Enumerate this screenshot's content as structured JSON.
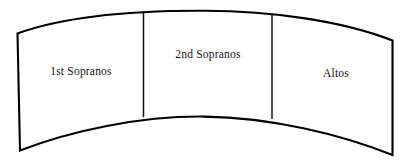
{
  "diagram": {
    "name": "choir-seating-arc",
    "type": "arc-band-three-sections",
    "background_color": "#ffffff",
    "outline_color": "#000000",
    "divider_color": "#111111",
    "text_color": "#141414",
    "sections": [
      {
        "id": "first-sopranos",
        "label": "1st Sopranos",
        "label_x": 81,
        "label_y": 72
      },
      {
        "id": "second-sopranos",
        "label": "2nd Sopranos",
        "label_x": 208,
        "label_y": 55
      },
      {
        "id": "altos",
        "label": "Altos",
        "label_x": 336,
        "label_y": 74
      }
    ],
    "geometry": {
      "outline_path": "M 17.5 33.5 C 70 14.5 140 10.5 205 10.8 C 270 11.2 340 20 392.5 40.5 L 392.5 155 C 340 134 270 117.5 205 116.6 C 140 115.8 70 131 20 150.5 Z",
      "dividers": [
        {
          "id": "divider-1",
          "path": "M 143.5 11.6 L 143.5 117.2"
        },
        {
          "id": "divider-2",
          "path": "M 272.0 13.6 L 272.0 119.0"
        }
      ]
    }
  }
}
